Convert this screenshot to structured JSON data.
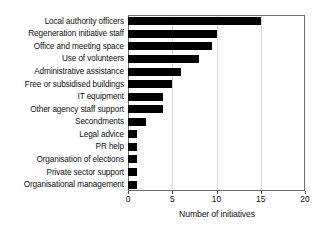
{
  "chart_data": {
    "type": "bar",
    "orientation": "horizontal",
    "title": "",
    "xlabel": "Number of initiatives",
    "ylabel": "",
    "xlim": [
      0,
      20
    ],
    "xticks": [
      0,
      5,
      10,
      15,
      20
    ],
    "grid": true,
    "legend": null,
    "bar_color": "#000000",
    "categories": [
      "Local authority officers",
      "Regeneration initiative staff",
      "Office and meeting space",
      "Use of volunteers",
      "Administrative assistance",
      "Free or subsidised buildings",
      "IT equipment",
      "Other agency staff support",
      "Secondments",
      "Legal advice",
      "PR help",
      "Organisation of elections",
      "Private sector support",
      "Organisational management"
    ],
    "values": [
      15,
      10,
      9.5,
      8,
      6,
      5,
      4,
      4,
      2,
      1,
      1,
      1,
      1,
      1
    ]
  },
  "axis": {
    "x_tick_labels": [
      "0",
      "5",
      "10",
      "15",
      "20"
    ],
    "x_axis_title": "Number of initiatives"
  }
}
